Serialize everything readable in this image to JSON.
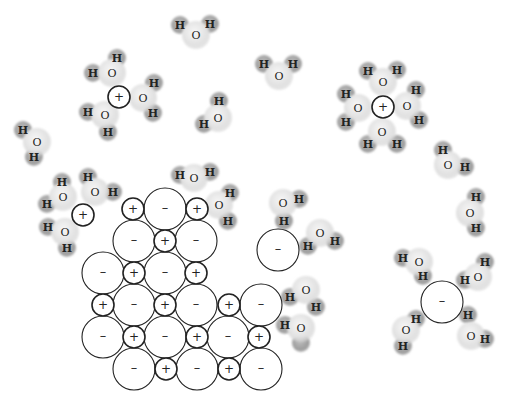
{
  "diagram": {
    "colors": {
      "background": "#ffffff",
      "ion_stroke": "#222222",
      "oxygen_fill": "#e4e4e4",
      "hydrogen_fill": "#a8a8a8"
    },
    "labels": {
      "cation": "+",
      "anion": "–",
      "oxygen": "O",
      "hydrogen": "H"
    },
    "lattice": {
      "cation_radius": 11,
      "anion_radius": 21,
      "ions": [
        {
          "type": "cation",
          "x": 133,
          "y": 209
        },
        {
          "type": "anion",
          "x": 165,
          "y": 209
        },
        {
          "type": "cation",
          "x": 197,
          "y": 209
        },
        {
          "type": "anion",
          "x": 134,
          "y": 241
        },
        {
          "type": "cation",
          "x": 165,
          "y": 241
        },
        {
          "type": "anion",
          "x": 196,
          "y": 241
        },
        {
          "type": "anion",
          "x": 103,
          "y": 273
        },
        {
          "type": "cation",
          "x": 134,
          "y": 273
        },
        {
          "type": "anion",
          "x": 165,
          "y": 273
        },
        {
          "type": "cation",
          "x": 196,
          "y": 273
        },
        {
          "type": "cation",
          "x": 103,
          "y": 305
        },
        {
          "type": "anion",
          "x": 134,
          "y": 305
        },
        {
          "type": "cation",
          "x": 165,
          "y": 305
        },
        {
          "type": "anion",
          "x": 196,
          "y": 305
        },
        {
          "type": "cation",
          "x": 229,
          "y": 305
        },
        {
          "type": "anion",
          "x": 261,
          "y": 305
        },
        {
          "type": "anion",
          "x": 103,
          "y": 337
        },
        {
          "type": "cation",
          "x": 134,
          "y": 337
        },
        {
          "type": "anion",
          "x": 165,
          "y": 337
        },
        {
          "type": "cation",
          "x": 197,
          "y": 337
        },
        {
          "type": "anion",
          "x": 228,
          "y": 337
        },
        {
          "type": "cation",
          "x": 259,
          "y": 337
        },
        {
          "type": "anion",
          "x": 134,
          "y": 369
        },
        {
          "type": "cation",
          "x": 166,
          "y": 369
        },
        {
          "type": "anion",
          "x": 197,
          "y": 369
        },
        {
          "type": "cation",
          "x": 229,
          "y": 369
        },
        {
          "type": "anion",
          "x": 261,
          "y": 369
        }
      ]
    },
    "free_ions": [
      {
        "type": "cation",
        "x": 119,
        "y": 97
      },
      {
        "type": "cation",
        "x": 383,
        "y": 107
      },
      {
        "type": "cation",
        "x": 83,
        "y": 215
      },
      {
        "type": "anion",
        "x": 278,
        "y": 250
      },
      {
        "type": "anion",
        "x": 442,
        "y": 302
      }
    ],
    "water_molecules": [
      {
        "o": [
          196,
          35
        ],
        "h": [
          [
            180,
            25
          ],
          [
            210,
            24
          ]
        ]
      },
      {
        "o": [
          112,
          73
        ],
        "h": [
          [
            117,
            58
          ],
          [
            93,
            73
          ]
        ]
      },
      {
        "o": [
          143,
          98
        ],
        "h": [
          [
            154,
            83
          ],
          [
            153,
            113
          ]
        ]
      },
      {
        "o": [
          105,
          115
        ],
        "h": [
          [
            88,
            112
          ],
          [
            108,
            132
          ]
        ]
      },
      {
        "o": [
          218,
          118
        ],
        "h": [
          [
            219,
            101
          ],
          [
            204,
            124
          ]
        ]
      },
      {
        "o": [
          279,
          76
        ],
        "h": [
          [
            264,
            64
          ],
          [
            293,
            64
          ]
        ]
      },
      {
        "o": [
          383,
          82
        ],
        "h": [
          [
            368,
            71
          ],
          [
            397,
            70
          ]
        ]
      },
      {
        "o": [
          358,
          108
        ],
        "h": [
          [
            346,
            94
          ],
          [
            346,
            122
          ]
        ]
      },
      {
        "o": [
          407,
          106
        ],
        "h": [
          [
            416,
            90
          ],
          [
            419,
            120
          ]
        ]
      },
      {
        "o": [
          382,
          132
        ],
        "h": [
          [
            368,
            144
          ],
          [
            397,
            144
          ]
        ]
      },
      {
        "o": [
          37,
          142
        ],
        "h": [
          [
            23,
            130
          ],
          [
            34,
            157
          ]
        ]
      },
      {
        "o": [
          63,
          197
        ],
        "h": [
          [
            62,
            182
          ],
          [
            47,
            204
          ]
        ]
      },
      {
        "o": [
          95,
          192
        ],
        "h": [
          [
            88,
            177
          ],
          [
            113,
            192
          ]
        ]
      },
      {
        "o": [
          65,
          232
        ],
        "h": [
          [
            48,
            227
          ],
          [
            67,
            248
          ]
        ]
      },
      {
        "o": [
          194,
          178
        ],
        "h": [
          [
            180,
            175
          ],
          [
            210,
            172
          ]
        ]
      },
      {
        "o": [
          219,
          205
        ],
        "h": [
          [
            230,
            193
          ],
          [
            228,
            221
          ]
        ]
      },
      {
        "o": [
          448,
          165
        ],
        "h": [
          [
            443,
            150
          ],
          [
            465,
            167
          ]
        ]
      },
      {
        "o": [
          470,
          213
        ],
        "h": [
          [
            476,
            197
          ],
          [
            476,
            228
          ]
        ]
      },
      {
        "o": [
          283,
          203
        ],
        "h": [
          [
            299,
            199
          ],
          [
            284,
            221
          ]
        ]
      },
      {
        "o": [
          320,
          233
        ],
        "h": [
          [
            308,
            246
          ],
          [
            335,
            241
          ]
        ]
      },
      {
        "o": [
          306,
          290
        ],
        "h": [
          [
            290,
            297
          ],
          [
            316,
            307
          ]
        ]
      },
      {
        "o": [
          301,
          328
        ],
        "h": [
          [
            285,
            325
          ],
          [
            301,
            343
          ]
        ]
      },
      {
        "o": [
          419,
          262
        ],
        "h": [
          [
            403,
            258
          ],
          [
            423,
            276
          ]
        ]
      },
      {
        "o": [
          478,
          277
        ],
        "h": [
          [
            485,
            262
          ],
          [
            465,
            280
          ]
        ]
      },
      {
        "o": [
          406,
          330
        ],
        "h": [
          [
            416,
            319
          ],
          [
            403,
            346
          ]
        ]
      },
      {
        "o": [
          471,
          336
        ],
        "h": [
          [
            468,
            315
          ],
          [
            485,
            339
          ]
        ]
      }
    ],
    "unlabeled_hydrogens": [
      [
        301,
        343
      ]
    ]
  }
}
